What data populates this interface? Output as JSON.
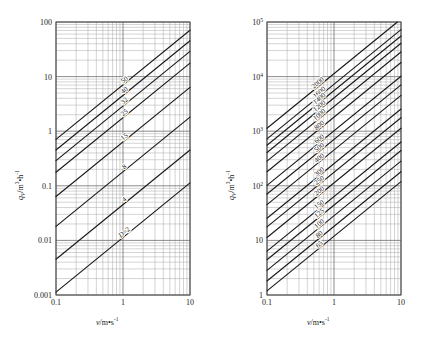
{
  "figure": {
    "title": "",
    "panels": [
      "left",
      "right"
    ]
  },
  "left": {
    "axis": {
      "xlabel": "v/m•s",
      "xlabel_sup": "-1",
      "ylabel_q": "q",
      "ylabel_sub": "V",
      "ylabel_rest": "/m",
      "ylabel_sup1": "3",
      "ylabel_mid": "•h",
      "ylabel_sup2": "-1",
      "xticks": [
        "0.1",
        "1",
        "10"
      ],
      "yticks": [
        "0.001",
        "0.01",
        "0.1",
        "1",
        "10",
        "100"
      ],
      "xlim": [
        0.1,
        10
      ],
      "ylim": [
        0.001,
        100
      ]
    },
    "curve_labels": [
      "50",
      "40",
      "32",
      "25",
      "15",
      "8",
      "4",
      "D=2"
    ]
  },
  "right": {
    "axis": {
      "xlabel": "v/m•s",
      "xlabel_sup": "-1",
      "ylabel_q": "q",
      "ylabel_sub": "V",
      "ylabel_rest": "/m",
      "ylabel_sup1": "3",
      "ylabel_mid": "•h",
      "ylabel_sup2": "-1",
      "xticks": [
        "0.1",
        "1",
        "10"
      ],
      "yticks": [
        "1",
        "10",
        "10",
        "10",
        "10",
        "10"
      ],
      "ytick_exps": [
        "",
        "",
        "2",
        "3",
        "4",
        "5"
      ],
      "xlim": [
        0.1,
        10
      ],
      "ylim": [
        1,
        100000
      ]
    },
    "curve_labels": [
      "2000",
      "1600",
      "1400",
      "1200",
      "1000",
      "800",
      "600",
      "500",
      "400",
      "300",
      "250",
      "200",
      "150",
      "125",
      "100",
      "80",
      "65"
    ]
  },
  "chart_data": [
    {
      "type": "line",
      "panel": "left",
      "title": "",
      "xlabel": "v/m·s⁻¹",
      "ylabel": "q_V/m³·h⁻¹",
      "xscale": "log",
      "yscale": "log",
      "xlim": [
        0.1,
        10
      ],
      "ylim": [
        0.001,
        100
      ],
      "xticks": [
        0.1,
        1,
        10
      ],
      "yticks": [
        0.001,
        0.01,
        0.1,
        1,
        10,
        100
      ],
      "grid": true,
      "legend": "inline-curve-labels",
      "description": "Volumetric flow rate vs mean velocity for small nominal pipe diameters D (mm). Each line is q_V = (pi/4)*D^2*v*3.6e-3 with slope 1 on log-log axes.",
      "series": [
        {
          "name": "50",
          "D_mm": 50,
          "x": [
            0.1,
            10
          ],
          "values": [
            0.7069,
            70.69
          ]
        },
        {
          "name": "40",
          "D_mm": 40,
          "x": [
            0.1,
            10
          ],
          "values": [
            0.4524,
            45.24
          ]
        },
        {
          "name": "32",
          "D_mm": 32,
          "x": [
            0.1,
            10
          ],
          "values": [
            0.2895,
            28.95
          ]
        },
        {
          "name": "25",
          "D_mm": 25,
          "x": [
            0.1,
            10
          ],
          "values": [
            0.1767,
            17.67
          ]
        },
        {
          "name": "15",
          "D_mm": 15,
          "x": [
            0.1,
            10
          ],
          "values": [
            0.0636,
            6.362
          ]
        },
        {
          "name": "8",
          "D_mm": 8,
          "x": [
            0.1,
            10
          ],
          "values": [
            0.0181,
            1.81
          ]
        },
        {
          "name": "4",
          "D_mm": 4,
          "x": [
            0.1,
            10
          ],
          "values": [
            0.00452,
            0.4524
          ]
        },
        {
          "name": "D=2",
          "D_mm": 2,
          "x": [
            0.1,
            10
          ],
          "values": [
            0.00113,
            0.1131
          ]
        }
      ]
    },
    {
      "type": "line",
      "panel": "right",
      "title": "",
      "xlabel": "v/m·s⁻¹",
      "ylabel": "q_V/m³·h⁻¹",
      "xscale": "log",
      "yscale": "log",
      "xlim": [
        0.1,
        10
      ],
      "ylim": [
        1,
        100000
      ],
      "xticks": [
        0.1,
        1,
        10
      ],
      "yticks": [
        1,
        10,
        100,
        1000,
        10000,
        100000
      ],
      "grid": true,
      "legend": "inline-curve-labels",
      "description": "Volumetric flow rate vs mean velocity for large nominal pipe diameters D (mm). Each line is q_V = (pi/4)*D^2*v*3.6e-3 with slope 1 on log-log axes.",
      "series": [
        {
          "name": "2000",
          "D_mm": 2000,
          "x": [
            0.1,
            10
          ],
          "values": [
            1130.97,
            113097
          ]
        },
        {
          "name": "1600",
          "D_mm": 1600,
          "x": [
            0.1,
            10
          ],
          "values": [
            723.82,
            72382
          ]
        },
        {
          "name": "1400",
          "D_mm": 1400,
          "x": [
            0.1,
            10
          ],
          "values": [
            554.18,
            55418
          ]
        },
        {
          "name": "1200",
          "D_mm": 1200,
          "x": [
            0.1,
            10
          ],
          "values": [
            407.15,
            40715
          ]
        },
        {
          "name": "1000",
          "D_mm": 1000,
          "x": [
            0.1,
            10
          ],
          "values": [
            282.74,
            28274
          ]
        },
        {
          "name": "800",
          "D_mm": 800,
          "x": [
            0.1,
            10
          ],
          "values": [
            180.96,
            18096
          ]
        },
        {
          "name": "600",
          "D_mm": 600,
          "x": [
            0.1,
            10
          ],
          "values": [
            101.79,
            10179
          ]
        },
        {
          "name": "500",
          "D_mm": 500,
          "x": [
            0.1,
            10
          ],
          "values": [
            70.69,
            7069
          ]
        },
        {
          "name": "400",
          "D_mm": 400,
          "x": [
            0.1,
            10
          ],
          "values": [
            45.24,
            4524
          ]
        },
        {
          "name": "300",
          "D_mm": 300,
          "x": [
            0.1,
            10
          ],
          "values": [
            25.45,
            2545
          ]
        },
        {
          "name": "250",
          "D_mm": 250,
          "x": [
            0.1,
            10
          ],
          "values": [
            17.67,
            1767
          ]
        },
        {
          "name": "200",
          "D_mm": 200,
          "x": [
            0.1,
            10
          ],
          "values": [
            11.31,
            1131
          ]
        },
        {
          "name": "150",
          "D_mm": 150,
          "x": [
            0.1,
            10
          ],
          "values": [
            6.36,
            636
          ]
        },
        {
          "name": "125",
          "D_mm": 125,
          "x": [
            0.1,
            10
          ],
          "values": [
            4.42,
            442
          ]
        },
        {
          "name": "100",
          "D_mm": 100,
          "x": [
            0.1,
            10
          ],
          "values": [
            2.83,
            283
          ]
        },
        {
          "name": "80",
          "D_mm": 80,
          "x": [
            0.1,
            10
          ],
          "values": [
            1.81,
            181
          ]
        },
        {
          "name": "65",
          "D_mm": 65,
          "x": [
            0.1,
            10
          ],
          "values": [
            1.19,
            119
          ]
        }
      ]
    }
  ],
  "style": {
    "grid_major_color": "#6e6e6e",
    "grid_minor_color": "#a8a8a8",
    "curve_color": "#1a1a1a",
    "axis_color": "#4a4a4a",
    "background": "#ffffff"
  }
}
